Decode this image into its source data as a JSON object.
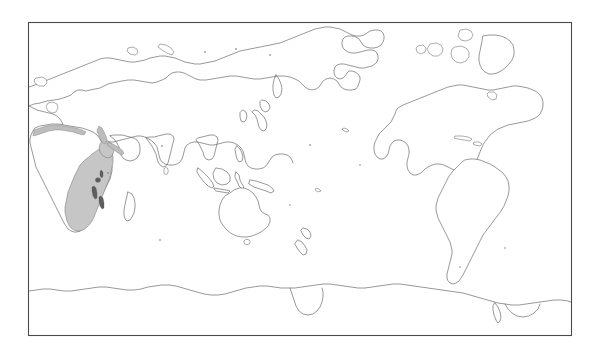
{
  "figure": {
    "kind": "world-distribution-map",
    "projection_label": "Pacific-centred cylindrical",
    "title": "",
    "caption": ""
  },
  "frame": {
    "x": 28,
    "y": 22,
    "width": 544,
    "height": 314,
    "border_color": "#4a4a4a",
    "background_color": "#ffffff"
  },
  "legend": {
    "shaded_label": "",
    "unshaded_label": "",
    "visible": false
  },
  "colors": {
    "page_background": "#ffffff",
    "map_background": "#ffffff",
    "coastline": "#5a5a5a",
    "frame_border": "#4a4a4a",
    "range_fill": "#c6c6c6",
    "range_outline": "#6e6e6e",
    "lake_fill": "#5e5e5e"
  },
  "distribution": {
    "type": "shaded-range",
    "shaded_regions": [
      "East Africa",
      "Southern Africa",
      "Ethiopia",
      "Kenya",
      "Tanzania",
      "Zambia",
      "Zimbabwe",
      "Mozambique",
      "South Africa",
      "North African Mediterranean coast",
      "Red Sea coast",
      "Southwest Arabian coast"
    ],
    "unshaded_regions": [
      "Eurasia",
      "North America",
      "South America",
      "Australia",
      "New Zealand",
      "Greenland",
      "Madagascar",
      "Antarctica",
      "Indonesia",
      "Japan"
    ]
  },
  "landmasses": [
    {
      "name": "eurasia",
      "shaded": false
    },
    {
      "name": "africa",
      "shaded": true
    },
    {
      "name": "north-america",
      "shaded": false
    },
    {
      "name": "south-america",
      "shaded": false
    },
    {
      "name": "australia",
      "shaded": false
    },
    {
      "name": "new-zealand",
      "shaded": false
    },
    {
      "name": "greenland",
      "shaded": false
    },
    {
      "name": "madagascar",
      "shaded": false
    },
    {
      "name": "antarctica",
      "shaded": false
    }
  ],
  "lakes": [
    {
      "name": "lake-victoria"
    },
    {
      "name": "lake-tanganyika"
    },
    {
      "name": "lake-malawi"
    },
    {
      "name": "lake-turkana"
    }
  ]
}
